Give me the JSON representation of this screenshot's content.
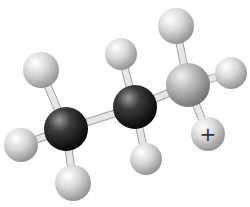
{
  "diagram": {
    "title": "Ball-and-stick model of a propyl cation",
    "molecule": "C3H7+",
    "charge_symbol": "+",
    "colors": {
      "background": "#ffffff",
      "carbon_dark": "#1a1a1a",
      "carbon_light": "#a8a8a8",
      "hydrogen": "#d8d8d8",
      "bond": "#e6e6e6"
    },
    "atoms": [
      {
        "id": "h1",
        "element": "H",
        "x": 41,
        "y": 70,
        "r": 18
      },
      {
        "id": "c1",
        "element": "C",
        "x": 66,
        "y": 129,
        "r": 22,
        "shade": "dark"
      },
      {
        "id": "h2",
        "element": "H",
        "x": 21,
        "y": 145,
        "r": 17
      },
      {
        "id": "h3",
        "element": "H",
        "x": 73,
        "y": 183,
        "r": 18
      },
      {
        "id": "c2",
        "element": "C",
        "x": 135,
        "y": 107,
        "r": 22,
        "shade": "dark"
      },
      {
        "id": "h4",
        "element": "H",
        "x": 121,
        "y": 54,
        "r": 16
      },
      {
        "id": "h5",
        "element": "H",
        "x": 146,
        "y": 159,
        "r": 16
      },
      {
        "id": "c3",
        "element": "C",
        "x": 188,
        "y": 85,
        "r": 22,
        "shade": "light"
      },
      {
        "id": "h6",
        "element": "H",
        "x": 176,
        "y": 26,
        "r": 18
      },
      {
        "id": "h7",
        "element": "H",
        "x": 231,
        "y": 73,
        "r": 16
      },
      {
        "id": "h8",
        "element": "H",
        "x": 208,
        "y": 134,
        "r": 17,
        "label": "+"
      }
    ],
    "bonds": [
      [
        "c1",
        "h1"
      ],
      [
        "c1",
        "h2"
      ],
      [
        "c1",
        "h3"
      ],
      [
        "c1",
        "c2"
      ],
      [
        "c2",
        "h4"
      ],
      [
        "c2",
        "h5"
      ],
      [
        "c2",
        "c3"
      ],
      [
        "c3",
        "h6"
      ],
      [
        "c3",
        "h7"
      ],
      [
        "c3",
        "h8"
      ]
    ]
  }
}
